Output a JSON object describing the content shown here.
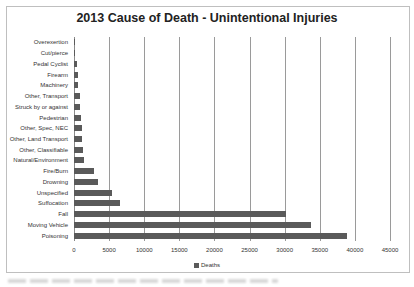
{
  "chart_data": {
    "type": "bar",
    "orientation": "horizontal",
    "title": "2013 Cause of Death - Unintentional Injuries",
    "xlabel": "",
    "ylabel": "",
    "xlim": [
      0,
      45000
    ],
    "x_ticks": [
      0,
      5000,
      10000,
      15000,
      20000,
      25000,
      30000,
      35000,
      40000,
      45000
    ],
    "grid": true,
    "legend_position": "bottom",
    "categories": [
      "Overexertion",
      "Cut/pierce",
      "Pedal Cyclist",
      "Firearm",
      "Machinery",
      "Other, Transport",
      "Struck by or against",
      "Pedestrian",
      "Other, Spec, NEC",
      "Other, Land Transport",
      "Other, Classifiable",
      "Natural/Environment",
      "Fire/Burn",
      "Drowning",
      "Unspecified",
      "Suffocation",
      "Fall",
      "Moving Vehicle",
      "Poisoning"
    ],
    "series": [
      {
        "name": "Deaths",
        "color": "#5a5a5a",
        "values": [
          120,
          150,
          400,
          500,
          550,
          900,
          850,
          1000,
          1100,
          1200,
          1250,
          1400,
          2800,
          3400,
          5400,
          6600,
          30200,
          33800,
          38900
        ]
      }
    ]
  },
  "legend": {
    "label": "Deaths"
  }
}
